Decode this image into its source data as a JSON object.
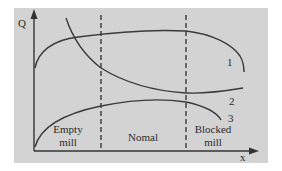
{
  "diagram": {
    "axes": {
      "y_label": "Q",
      "x_label": "x"
    },
    "regions": [
      {
        "id": "empty",
        "line1": "Empty",
        "line2": "mill"
      },
      {
        "id": "normal",
        "line1": "Nomal"
      },
      {
        "id": "blocked",
        "line1": "Blocked",
        "line2": "mill"
      }
    ],
    "curves": [
      {
        "id": "curve-1",
        "label": "1"
      },
      {
        "id": "curve-2",
        "label": "2"
      },
      {
        "id": "curve-3",
        "label": "3"
      }
    ],
    "colors": {
      "background": "#d3d3d3",
      "ink": "#3a3a3a"
    }
  }
}
